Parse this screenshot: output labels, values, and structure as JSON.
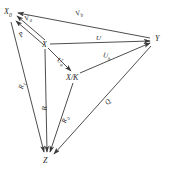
{
  "diagram": {
    "type": "vector-commutative-diagram",
    "background_color": "#ffffff",
    "stroke_color": "#3a3a3a",
    "text_color": "#2b2b2b",
    "nodes": [
      {
        "id": "X0",
        "label": "X",
        "sub": "0",
        "x": 6,
        "y": 10
      },
      {
        "id": "X",
        "label": "X",
        "sub": "",
        "x": 43,
        "y": 42
      },
      {
        "id": "XK",
        "label": "X/K",
        "sub": "",
        "x": 68,
        "y": 76
      },
      {
        "id": "Y",
        "label": "Y",
        "sub": "",
        "x": 154,
        "y": 38
      },
      {
        "id": "Z",
        "label": "Z",
        "sub": "",
        "x": 44,
        "y": 158
      }
    ],
    "edges": [
      {
        "id": "Va",
        "label": "V",
        "sub": "a",
        "from": "X",
        "to": "X0",
        "lx": 26,
        "ly": 17
      },
      {
        "id": "Vb",
        "label": "V",
        "sub": "b",
        "from": "Y",
        "to": "X0",
        "lx": 76,
        "ly": 12
      },
      {
        "id": "P",
        "label": "P",
        "sub": "",
        "from": "X",
        "to": "X0",
        "lx": 21,
        "ly": 34
      },
      {
        "id": "U",
        "label": "U",
        "sub": "",
        "from": "X",
        "to": "Y",
        "lx": 96,
        "ly": 36
      },
      {
        "id": "Ua",
        "label": "U",
        "sub": "a",
        "from": "X",
        "to": "XK",
        "lx": 58,
        "ly": 57
      },
      {
        "id": "Ub",
        "label": "U",
        "sub": "b",
        "from": "XK",
        "to": "Y",
        "lx": 104,
        "ly": 53
      },
      {
        "id": "R1",
        "label": "R",
        "sub": "1",
        "from": "X0",
        "to": "Z",
        "lx": 23,
        "ly": 86
      },
      {
        "id": "R",
        "label": "R",
        "sub": "",
        "from": "X",
        "to": "Z",
        "lx": 45,
        "ly": 108
      },
      {
        "id": "Ra",
        "label": "R",
        "sub": "a",
        "from": "XK",
        "to": "Z",
        "lx": 66,
        "ly": 120
      },
      {
        "id": "Q",
        "label": "Q",
        "sub": "",
        "from": "Y",
        "to": "Z",
        "lx": 108,
        "ly": 102
      }
    ]
  }
}
